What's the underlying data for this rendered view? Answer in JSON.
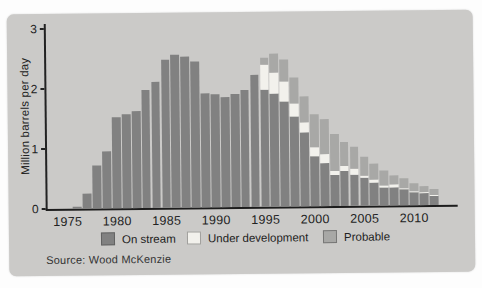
{
  "figure": {
    "source": "Source: Wood McKenzie"
  },
  "chart_data": {
    "type": "bar",
    "stacked": true,
    "title": "",
    "xlabel": "",
    "ylabel": "Million barrels per day",
    "ylim": [
      0,
      3
    ],
    "yticks": [
      0,
      1,
      2,
      3
    ],
    "xticks": [
      1975,
      1980,
      1985,
      1990,
      1995,
      2000,
      2005,
      2010
    ],
    "grid": false,
    "legend_position": "bottom",
    "categories": [
      1976,
      1977,
      1978,
      1979,
      1980,
      1981,
      1982,
      1983,
      1984,
      1985,
      1986,
      1987,
      1988,
      1989,
      1990,
      1991,
      1992,
      1993,
      1994,
      1995,
      1996,
      1997,
      1998,
      1999,
      2000,
      2001,
      2002,
      2003,
      2004,
      2005,
      2006,
      2007,
      2008,
      2009,
      2010,
      2011,
      2012
    ],
    "series": [
      {
        "name": "On stream",
        "color": "#818181",
        "values": [
          0.03,
          0.25,
          0.72,
          0.95,
          1.52,
          1.57,
          1.62,
          1.97,
          2.1,
          2.46,
          2.55,
          2.52,
          2.44,
          1.9,
          1.88,
          1.83,
          1.88,
          1.95,
          2.2,
          1.95,
          1.88,
          1.75,
          1.5,
          1.23,
          0.84,
          0.72,
          0.51,
          0.58,
          0.52,
          0.46,
          0.38,
          0.3,
          0.3,
          0.26,
          0.22,
          0.2,
          0.16
        ]
      },
      {
        "name": "Under development",
        "color": "#f2f1ec",
        "values": [
          0,
          0,
          0,
          0,
          0,
          0,
          0,
          0,
          0,
          0,
          0,
          0,
          0,
          0,
          0,
          0,
          0,
          0,
          0,
          0.41,
          0.35,
          0.33,
          0.21,
          0.17,
          0.14,
          0.14,
          0.08,
          0.09,
          0.09,
          0.04,
          0.05,
          0.04,
          0.05,
          0.03,
          0.02,
          0.02,
          0.01
        ]
      },
      {
        "name": "Probable",
        "color": "#a8a8a6",
        "values": [
          0,
          0,
          0,
          0,
          0,
          0,
          0,
          0,
          0,
          0,
          0,
          0,
          0,
          0,
          0,
          0,
          0,
          0,
          0,
          0.13,
          0.32,
          0.37,
          0.44,
          0.44,
          0.55,
          0.59,
          0.61,
          0.39,
          0.37,
          0.32,
          0.27,
          0.24,
          0.15,
          0.16,
          0.13,
          0.09,
          0.09
        ]
      }
    ]
  }
}
